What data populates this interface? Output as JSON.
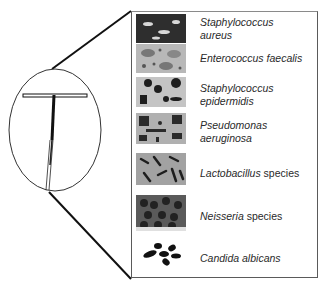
{
  "diagram": {
    "type": "illustration",
    "device_icon": "iud-t-shape-icon",
    "organisms": [
      {
        "genus_italic": "Staphylococcus",
        "line2_italic": "aureus",
        "suffix": "",
        "tile_icon": "cocci-clusters-micrograph",
        "tile_color": "#3a3a3a"
      },
      {
        "genus_italic": "Enterococcus faecalis",
        "line2_italic": "",
        "suffix": "",
        "tile_icon": "enterococcus-micrograph",
        "tile_color": "#9a9a9a"
      },
      {
        "genus_italic": "Staphylococcus",
        "line2_italic": "epidermidis",
        "suffix": "",
        "tile_icon": "staph-epidermidis-micrograph",
        "tile_color": "#bdbdbd"
      },
      {
        "genus_italic": "Pseudomonas",
        "line2_italic": "aeruginosa",
        "suffix": "",
        "tile_icon": "pseudomonas-micrograph",
        "tile_color": "#a8a8a8"
      },
      {
        "genus_italic": "Lactobacillus",
        "line2_italic": "",
        "suffix": " species",
        "tile_icon": "lactobacillus-micrograph",
        "tile_color": "#8e8e8e"
      },
      {
        "genus_italic": "Neisseria",
        "line2_italic": "",
        "suffix": " species",
        "tile_icon": "neisseria-micrograph",
        "tile_color": "#6a6a6a"
      },
      {
        "genus_italic": "Candida albicans",
        "line2_italic": "",
        "suffix": "",
        "tile_icon": "candida-micrograph",
        "tile_color": "#ffffff"
      }
    ]
  }
}
